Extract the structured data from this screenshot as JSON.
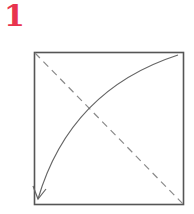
{
  "step": {
    "number": "1",
    "color": "#e8344e"
  },
  "diagram": {
    "type": "origami-fold-step",
    "square": {
      "x": 34,
      "y": 52,
      "width": 149,
      "height": 152,
      "stroke": "#555555"
    },
    "valley_fold_line": {
      "style": "dashed",
      "from": "top-left",
      "to": "bottom-right",
      "stroke": "#8a8a8a"
    },
    "fold_arrow": {
      "from": "top-right",
      "to": "bottom-left",
      "style": "curved-arrow",
      "stroke": "#666666"
    }
  }
}
